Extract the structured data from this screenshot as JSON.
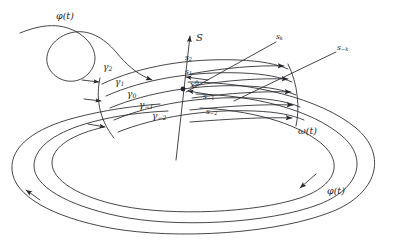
{
  "figure": {
    "background_color": "#ffffff",
    "ink_color": "#26262b",
    "width": 395,
    "height": 247
  },
  "axis": {
    "name": "S",
    "label": "S",
    "direction": "up"
  },
  "point": {
    "name": "base-point",
    "label_main": "x",
    "label_sup": "0"
  },
  "curves": [
    {
      "id": "phi_top",
      "label": "φ(t)",
      "x": 56,
      "y": 16
    },
    {
      "id": "omega",
      "label": "ω(t)",
      "x": 298,
      "y": 131
    },
    {
      "id": "phi_bottom",
      "label": "φ(t)",
      "x": 327,
      "y": 191
    }
  ],
  "gamma_labels": [
    {
      "id": "g2",
      "sym": "γ",
      "sub": "2",
      "x": 109,
      "y": 69
    },
    {
      "id": "g1",
      "sym": "γ",
      "sub": "1",
      "x": 119,
      "y": 84
    },
    {
      "id": "g0",
      "sym": "γ",
      "sub": "0",
      "x": 131,
      "y": 96
    },
    {
      "id": "gm1",
      "sym": "γ",
      "sub": "−1",
      "x": 142,
      "y": 107
    },
    {
      "id": "gm2",
      "sym": "γ",
      "sub": "−2",
      "x": 155,
      "y": 117
    }
  ],
  "section_labels": [
    {
      "id": "s2",
      "sym": "s",
      "sub": "2",
      "x": 185,
      "y": 58
    },
    {
      "id": "s1",
      "sym": "s",
      "sub": "1",
      "x": 185,
      "y": 72
    },
    {
      "id": "sm1",
      "sym": "s",
      "sub": "−1",
      "x": 203,
      "y": 97
    },
    {
      "id": "sm2",
      "sym": "s",
      "sub": "−2",
      "x": 206,
      "y": 112
    },
    {
      "id": "sk",
      "sym": "s",
      "sub": "k",
      "x": 276,
      "y": 37
    },
    {
      "id": "smk",
      "sym": "s",
      "sub": "−k",
      "x": 337,
      "y": 48
    }
  ]
}
